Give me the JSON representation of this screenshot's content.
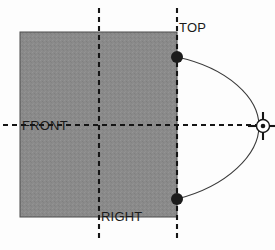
{
  "diagram": {
    "background_color": "#fdfdfd",
    "face_fill_color": "#8a8a8a",
    "line_color": "#1a1a1a",
    "labels": {
      "top": "TOP",
      "front": "FRONT",
      "right": "RIGHT"
    },
    "geometry": {
      "face_rect": {
        "x": 20,
        "y": 32,
        "width": 157,
        "height": 185
      },
      "vertical_axis_center_x": 99,
      "vertical_axis_right_x": 177,
      "horizontal_axis_y": 125,
      "target_center": {
        "x": 263,
        "y": 126
      },
      "target_radius": 6,
      "dot_top": {
        "x": 177,
        "y": 57,
        "r": 6
      },
      "dot_bottom": {
        "x": 177,
        "y": 199,
        "r": 6
      },
      "arc_apex_x": 259
    },
    "markers": {
      "dot_top_name": "vertex-dot-top",
      "dot_bottom_name": "vertex-dot-bottom",
      "target_name": "view-target-crosshair"
    }
  }
}
